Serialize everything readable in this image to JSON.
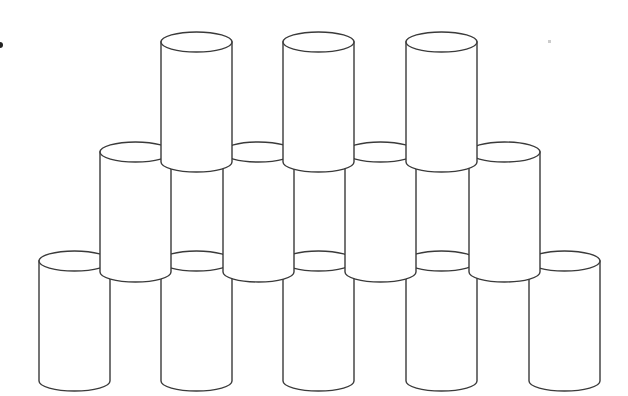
{
  "diagram": {
    "type": "stacked-cylinders",
    "stroke_color": "#3a3a3a",
    "fill_color": "#ffffff",
    "cylinder": {
      "width": 71,
      "height": 120,
      "ellipse_ry": 10
    },
    "rows": [
      {
        "name": "top",
        "count": 3,
        "top_y": 42,
        "x": [
          161,
          283,
          406
        ]
      },
      {
        "name": "middle",
        "count": 4,
        "top_y": 152,
        "x": [
          100,
          223,
          345,
          469
        ]
      },
      {
        "name": "bottom",
        "count": 5,
        "top_y": 261,
        "x": [
          39,
          161,
          283,
          406,
          529
        ]
      }
    ]
  }
}
